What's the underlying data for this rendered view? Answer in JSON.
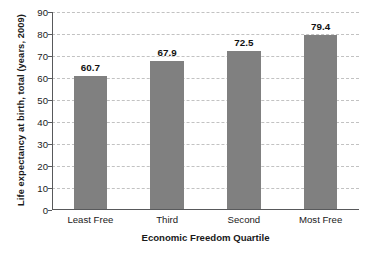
{
  "chart_data": {
    "type": "bar",
    "title": "",
    "subtitle": "",
    "xlabel": "Economic Freedom Quartile",
    "ylabel": "Life expectancy at birth, total (years, 2009)",
    "categories": [
      "Least Free",
      "Third",
      "Second",
      "Most Free"
    ],
    "values": [
      60.7,
      67.9,
      72.5,
      79.4
    ],
    "value_labels": [
      "60.7",
      "67.9",
      "72.5",
      "79.4"
    ],
    "ylim": [
      0,
      90
    ],
    "ytick_labels": [
      "0",
      "10",
      "20",
      "30",
      "40",
      "50",
      "60",
      "70",
      "80",
      "90"
    ],
    "ytick_values": [
      0,
      10,
      20,
      30,
      40,
      50,
      60,
      70,
      80,
      90
    ],
    "grid": "horizontal-dashed",
    "legend": "none",
    "colors": {
      "bar_fill": "#808080",
      "gridline": "#c2c2c2",
      "axis_line": "#58595b",
      "text": "#1a1a1a",
      "background": "#ffffff"
    }
  }
}
